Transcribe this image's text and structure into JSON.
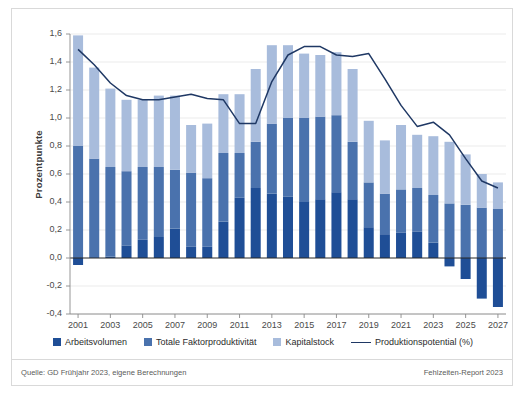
{
  "figure": {
    "y_axis_title": "Prozentpunkte",
    "source_note": "Quelle: GD Frühjahr 2023, eigene Berechnungen",
    "report_note": "Fehlzeiten-Report 2023"
  },
  "legend": [
    {
      "label": "Arbeitsvolumen",
      "type": "swatch",
      "color": "#1f4e96"
    },
    {
      "label": "Totale Faktorproduktivität",
      "type": "swatch",
      "color": "#4a72ad"
    },
    {
      "label": "Kapitalstock",
      "type": "swatch",
      "color": "#a8bcdc"
    },
    {
      "label": "Produktionspotential (%)",
      "type": "line",
      "color": "#1f3864"
    }
  ],
  "chart_data": {
    "type": "bar",
    "title": "",
    "xlabel": "",
    "ylabel": "Prozentpunkte",
    "ylim": [
      -0.4,
      1.6
    ],
    "ytick_step": 0.2,
    "ytick_labels": [
      "1,6",
      "1,4",
      "1,2",
      "1,0",
      "0,8",
      "0,6",
      "0,4",
      "0,2",
      "0,0",
      "-0,2",
      "-0,4"
    ],
    "ytick_values": [
      1.6,
      1.4,
      1.2,
      1.0,
      0.8,
      0.6,
      0.4,
      0.2,
      0.0,
      -0.2,
      -0.4
    ],
    "grid": true,
    "legend_position": "bottom",
    "stacked": true,
    "categories": [
      "2001",
      "2002",
      "2003",
      "2004",
      "2005",
      "2006",
      "2007",
      "2008",
      "2009",
      "2010",
      "2011",
      "2012",
      "2013",
      "2014",
      "2015",
      "2016",
      "2017",
      "2018",
      "2019",
      "2020",
      "2021",
      "2022",
      "2023",
      "2024",
      "2025",
      "2026",
      "2027"
    ],
    "xtick_labels": [
      "2001",
      "2003",
      "2005",
      "2007",
      "2009",
      "2011",
      "2013",
      "2015",
      "2017",
      "2019",
      "2021",
      "2023",
      "2025",
      "2027"
    ],
    "series": [
      {
        "name": "Arbeitsvolumen",
        "color": "#1f4e96",
        "values": [
          -0.05,
          0.0,
          0.01,
          0.09,
          0.13,
          0.15,
          0.21,
          0.08,
          0.08,
          0.26,
          0.43,
          0.5,
          0.46,
          0.44,
          0.4,
          0.42,
          0.47,
          0.42,
          0.22,
          0.17,
          0.18,
          0.19,
          0.11,
          -0.06,
          -0.15,
          -0.29,
          -0.35
        ]
      },
      {
        "name": "Totale Faktorproduktivität",
        "color": "#4a72ad",
        "values": [
          0.8,
          0.71,
          0.64,
          0.53,
          0.52,
          0.5,
          0.42,
          0.53,
          0.49,
          0.49,
          0.32,
          0.33,
          0.5,
          0.56,
          0.6,
          0.59,
          0.55,
          0.41,
          0.32,
          0.29,
          0.31,
          0.31,
          0.34,
          0.39,
          0.38,
          0.36,
          0.35
        ]
      },
      {
        "name": "Kapitalstock",
        "color": "#a8bcdc",
        "values": [
          0.79,
          0.65,
          0.56,
          0.51,
          0.48,
          0.51,
          0.53,
          0.34,
          0.39,
          0.42,
          0.42,
          0.52,
          0.56,
          0.52,
          0.46,
          0.44,
          0.45,
          0.52,
          0.44,
          0.38,
          0.46,
          0.38,
          0.42,
          0.44,
          0.36,
          0.24,
          0.19
        ]
      }
    ],
    "line_series": {
      "name": "Produktionspotential (%)",
      "color": "#1f3864",
      "values": [
        1.49,
        1.38,
        1.25,
        1.16,
        1.13,
        1.13,
        1.15,
        1.17,
        1.14,
        1.13,
        0.96,
        0.96,
        1.26,
        1.45,
        1.51,
        1.51,
        1.45,
        1.44,
        1.46,
        1.28,
        1.09,
        0.94,
        0.97,
        0.88,
        0.71,
        0.55,
        0.5
      ]
    }
  }
}
